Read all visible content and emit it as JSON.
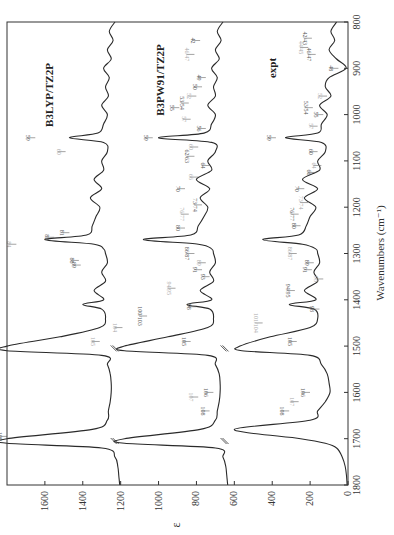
{
  "chart_data": {
    "type": "line",
    "orientation": "rotated-90-cw",
    "title": "",
    "xlabel": "Wavenumbers (cm⁻¹)",
    "ylabel": "ε",
    "xlim": [
      800,
      1800
    ],
    "ylim": [
      0,
      1800
    ],
    "x_ticks": [
      800,
      900,
      1000,
      1100,
      1200,
      1300,
      1400,
      1500,
      1600,
      1700,
      1800
    ],
    "y_ticks": [
      0,
      200,
      400,
      600,
      800,
      1000,
      1200,
      1400,
      1600
    ],
    "grid": false,
    "legend": "none",
    "series": [
      {
        "name": "B3LYP/TZ2P",
        "offset": 1200,
        "x": [
          800,
          820,
          840,
          860,
          880,
          900,
          920,
          940,
          960,
          980,
          1000,
          1020,
          1040,
          1050,
          1060,
          1080,
          1100,
          1120,
          1140,
          1160,
          1180,
          1200,
          1220,
          1240,
          1260,
          1270,
          1280,
          1290,
          1300,
          1320,
          1340,
          1360,
          1380,
          1400,
          1410,
          1420,
          1440,
          1460,
          1480,
          1500,
          1510,
          1520,
          1540,
          1560,
          1580,
          1600,
          1620,
          1640,
          1660,
          1680,
          1700,
          1710,
          1720,
          1740,
          1760,
          1780,
          1800
        ],
        "values": [
          1230,
          1260,
          1240,
          1270,
          1250,
          1290,
          1260,
          1280,
          1265,
          1300,
          1270,
          1290,
          1320,
          1470,
          1290,
          1270,
          1300,
          1290,
          1340,
          1300,
          1360,
          1310,
          1330,
          1350,
          1380,
          1600,
          1340,
          1290,
          1280,
          1270,
          1300,
          1280,
          1340,
          1290,
          1400,
          1300,
          1280,
          1310,
          1520,
          1800,
          1800,
          1300,
          1270,
          1255,
          1250,
          1250,
          1255,
          1265,
          1270,
          1350,
          1800,
          1800,
          1300,
          1230,
          1215,
          1210,
          1205
        ]
      },
      {
        "name": "B3PW91/TZ2P",
        "offset": 620,
        "x": [
          800,
          820,
          840,
          860,
          880,
          900,
          920,
          940,
          960,
          980,
          1000,
          1020,
          1040,
          1050,
          1060,
          1080,
          1100,
          1120,
          1140,
          1160,
          1180,
          1200,
          1220,
          1240,
          1260,
          1270,
          1280,
          1290,
          1300,
          1320,
          1340,
          1360,
          1380,
          1400,
          1410,
          1420,
          1440,
          1460,
          1480,
          1500,
          1510,
          1520,
          1540,
          1560,
          1580,
          1600,
          1620,
          1640,
          1660,
          1680,
          1700,
          1710,
          1720,
          1740,
          1760,
          1780,
          1800
        ],
        "values": [
          660,
          690,
          670,
          700,
          680,
          720,
          690,
          710,
          700,
          740,
          700,
          720,
          760,
          1000,
          720,
          700,
          740,
          720,
          800,
          730,
          780,
          740,
          760,
          790,
          830,
          1080,
          790,
          720,
          710,
          700,
          730,
          710,
          780,
          720,
          850,
          730,
          710,
          740,
          950,
          1180,
          1180,
          740,
          700,
          680,
          675,
          675,
          680,
          690,
          700,
          780,
          1180,
          1180,
          700,
          660,
          645,
          640,
          635
        ]
      },
      {
        "name": "expt",
        "offset": 0,
        "x": [
          800,
          820,
          840,
          860,
          880,
          900,
          920,
          940,
          960,
          980,
          1000,
          1020,
          1040,
          1050,
          1060,
          1080,
          1100,
          1120,
          1140,
          1160,
          1180,
          1200,
          1220,
          1240,
          1260,
          1270,
          1280,
          1290,
          1300,
          1320,
          1340,
          1360,
          1380,
          1400,
          1410,
          1420,
          1440,
          1460,
          1480,
          1500,
          1510,
          1520,
          1540,
          1560,
          1580,
          1600,
          1620,
          1640,
          1660,
          1680,
          1700,
          1710,
          1720,
          1740,
          1760,
          1780,
          1800
        ],
        "values": [
          60,
          90,
          70,
          100,
          60,
          10,
          100,
          120,
          90,
          150,
          110,
          140,
          160,
          330,
          140,
          120,
          160,
          150,
          240,
          160,
          230,
          170,
          200,
          220,
          260,
          450,
          240,
          170,
          160,
          150,
          180,
          160,
          230,
          170,
          310,
          180,
          160,
          200,
          410,
          570,
          560,
          200,
          140,
          110,
          100,
          95,
          120,
          160,
          200,
          600,
          250,
          120,
          60,
          30,
          15,
          8,
          5
        ]
      }
    ],
    "panel_labels": [
      "B3LYP/TZ2P",
      "B3PW91/TZ2P",
      "expt"
    ],
    "peak_annotations": [
      "41",
      "42/43",
      "44/45",
      "46/47",
      "48",
      "49",
      "50",
      "52",
      "53/54",
      "55",
      "56",
      "57",
      "59",
      "60",
      "62/63",
      "64",
      "65",
      "66",
      "67",
      "69",
      "70",
      "71",
      "73/74",
      "75",
      "76/77",
      "78",
      "80",
      "81",
      "82",
      "84",
      "85",
      "86/87",
      "88",
      "89",
      "91",
      "92",
      "93",
      "94/95",
      "96",
      "97",
      "98",
      "99",
      "100",
      "101",
      "102",
      "103",
      "104",
      "105",
      "106",
      "107",
      "108",
      "109",
      "110"
    ]
  },
  "axes": {
    "wavenumber_label": "Wavenumbers (cm⁻¹)",
    "epsilon_label": "ε",
    "wavenumber_ticks": [
      "800",
      "900",
      "1000",
      "1100",
      "1200",
      "1300",
      "1400",
      "1500",
      "1600",
      "1700",
      "1800"
    ],
    "epsilon_ticks": [
      "0",
      "200",
      "400",
      "600",
      "800",
      "1000",
      "1200",
      "1400",
      "1600"
    ]
  },
  "panels": {
    "b3lyp": "B3LYP/TZ2P",
    "b3pw91": "B3PW91/TZ2P",
    "expt": "expt"
  },
  "annotations_expt": [
    {
      "t": "42/43",
      "wn": 835,
      "eps": 180
    },
    {
      "t": "44/45",
      "wn": 855,
      "eps": 200
    },
    {
      "t": "46/47",
      "wn": 870,
      "eps": 160
    },
    {
      "t": "48",
      "wn": 900,
      "eps": 40
    },
    {
      "t": "52",
      "wn": 960,
      "eps": 100
    },
    {
      "t": "53/54",
      "wn": 985,
      "eps": 175
    },
    {
      "t": "55",
      "wn": 1000,
      "eps": 120
    },
    {
      "t": "57",
      "wn": 1025,
      "eps": 150
    },
    {
      "t": "59",
      "wn": 1050,
      "eps": 370
    },
    {
      "t": "60",
      "wn": 1080,
      "eps": 150
    },
    {
      "t": "64",
      "wn": 1110,
      "eps": 130
    },
    {
      "t": "66",
      "wn": 1125,
      "eps": 160
    },
    {
      "t": "70",
      "wn": 1160,
      "eps": 220
    },
    {
      "t": "73/74",
      "wn": 1190,
      "eps": 200
    },
    {
      "t": "76/77",
      "wn": 1215,
      "eps": 250
    },
    {
      "t": "80",
      "wn": 1240,
      "eps": 240
    },
    {
      "t": "86/87",
      "wn": 1300,
      "eps": 260
    },
    {
      "t": "89",
      "wn": 1320,
      "eps": 170
    },
    {
      "t": "91",
      "wn": 1335,
      "eps": 180
    },
    {
      "t": "93",
      "wn": 1355,
      "eps": 120
    },
    {
      "t": "94/95",
      "wn": 1380,
      "eps": 270
    },
    {
      "t": "98",
      "wn": 1420,
      "eps": 140
    },
    {
      "t": "101/104",
      "wn": 1450,
      "eps": 440
    },
    {
      "t": "105",
      "wn": 1490,
      "eps": 260
    },
    {
      "t": "106",
      "wn": 1600,
      "eps": 190
    },
    {
      "t": "107",
      "wn": 1620,
      "eps": 250
    },
    {
      "t": "108",
      "wn": 1640,
      "eps": 300
    }
  ],
  "annotations_b3pw91": [
    {
      "t": "42",
      "wn": 840,
      "eps": 770
    },
    {
      "t": "46/47",
      "wn": 870,
      "eps": 800
    },
    {
      "t": "49",
      "wn": 920,
      "eps": 740
    },
    {
      "t": "50",
      "wn": 940,
      "eps": 760
    },
    {
      "t": "52",
      "wn": 960,
      "eps": 790
    },
    {
      "t": "53/54",
      "wn": 975,
      "eps": 830
    },
    {
      "t": "55",
      "wn": 985,
      "eps": 880
    },
    {
      "t": "57",
      "wn": 1010,
      "eps": 820
    },
    {
      "t": "56",
      "wn": 1030,
      "eps": 740
    },
    {
      "t": "59",
      "wn": 1050,
      "eps": 1020
    },
    {
      "t": "60",
      "wn": 1070,
      "eps": 780
    },
    {
      "t": "62/63",
      "wn": 1090,
      "eps": 800
    },
    {
      "t": "64",
      "wn": 1110,
      "eps": 720
    },
    {
      "t": "66",
      "wn": 1135,
      "eps": 780
    },
    {
      "t": "70",
      "wn": 1160,
      "eps": 850
    },
    {
      "t": "73/74",
      "wn": 1195,
      "eps": 760
    },
    {
      "t": "76/77",
      "wn": 1215,
      "eps": 830
    },
    {
      "t": "80",
      "wn": 1245,
      "eps": 850
    },
    {
      "t": "86/87",
      "wn": 1300,
      "eps": 800
    },
    {
      "t": "89",
      "wn": 1320,
      "eps": 740
    },
    {
      "t": "91",
      "wn": 1335,
      "eps": 760
    },
    {
      "t": "93",
      "wn": 1350,
      "eps": 720
    },
    {
      "t": "94/95",
      "wn": 1375,
      "eps": 900
    },
    {
      "t": "98",
      "wn": 1415,
      "eps": 790
    },
    {
      "t": "100/103",
      "wn": 1435,
      "eps": 1050
    },
    {
      "t": "104",
      "wn": 1460,
      "eps": 1180
    },
    {
      "t": "105",
      "wn": 1490,
      "eps": 820
    },
    {
      "t": "106",
      "wn": 1600,
      "eps": 700
    },
    {
      "t": "107",
      "wn": 1610,
      "eps": 780
    },
    {
      "t": "108",
      "wn": 1640,
      "eps": 720
    }
  ],
  "annotations_b3lyp": [
    {
      "t": "59",
      "wn": 1050,
      "eps": 1640
    },
    {
      "t": "60",
      "wn": 1080,
      "eps": 1480
    },
    {
      "t": "81",
      "wn": 1255,
      "eps": 1460
    },
    {
      "t": "82",
      "wn": 1265,
      "eps": 1540
    },
    {
      "t": "84",
      "wn": 1280,
      "eps": 1740
    },
    {
      "t": "88",
      "wn": 1315,
      "eps": 1410
    },
    {
      "t": "89",
      "wn": 1325,
      "eps": 1400
    },
    {
      "t": "105",
      "wn": 1490,
      "eps": 1300
    },
    {
      "t": "109",
      "wn": 1695,
      "eps": 1790
    }
  ]
}
